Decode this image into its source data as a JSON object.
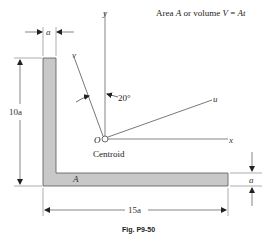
{
  "header": {
    "area_label_prefix": "Area ",
    "area_symbol": "A",
    "area_label_mid": " or volume ",
    "volume_symbol": "V",
    "area_label_eq": " = ",
    "volume_expr": "At"
  },
  "axes": {
    "y_label": "y",
    "x_label": "x",
    "u_label": "u",
    "v_label": "v",
    "angle_label": "20°",
    "origin_label": "O",
    "centroid_label": "Centroid"
  },
  "shape": {
    "area_label": "A",
    "fill_color": "#c8c8c8",
    "stroke_color": "#555555"
  },
  "dimensions": {
    "thickness_top": "a",
    "height": "10a",
    "width": "15a",
    "thickness_right": "a"
  },
  "caption": "Fig. P9-50"
}
